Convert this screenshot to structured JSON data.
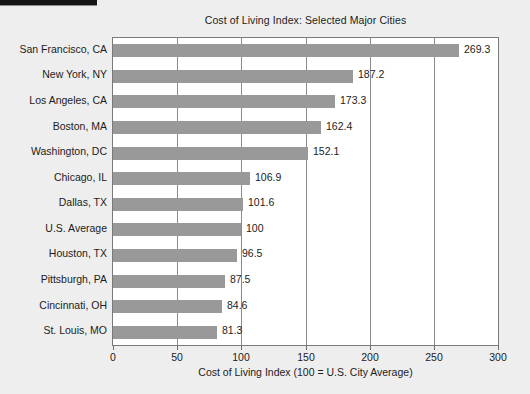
{
  "chart_data": {
    "type": "bar",
    "orientation": "horizontal",
    "title": "Cost of Living Index: Selected Major Cities",
    "xlabel": "Cost of Living Index (100 = U.S. City Average)",
    "ylabel": "",
    "xlim": [
      0,
      300
    ],
    "xticks": [
      0,
      50,
      100,
      150,
      200,
      250,
      300
    ],
    "grid": "vertical",
    "legend": "none",
    "bar_color": "#999999",
    "plot_background": "#ffffff",
    "figure_background": "#eeeeee",
    "categories": [
      "San Francisco, CA",
      "New York, NY",
      "Los Angeles, CA",
      "Boston, MA",
      "Washington, DC",
      "Chicago, IL",
      "Dallas, TX",
      "U.S. Average",
      "Houston, TX",
      "Pittsburgh, PA",
      "Cincinnati, OH",
      "St. Louis, MO"
    ],
    "values": [
      269.3,
      187.2,
      173.3,
      162.4,
      152.1,
      106.9,
      101.6,
      100,
      96.5,
      87.5,
      84.6,
      81.3
    ],
    "value_labels": [
      "269.3",
      "187.2",
      "173.3",
      "162.4",
      "152.1",
      "106.9",
      "101.6",
      "100",
      "96.5",
      "87.5",
      "84.6",
      "81.3"
    ],
    "xtick_labels": [
      "0",
      "50",
      "100",
      "150",
      "200",
      "250",
      "300"
    ]
  }
}
